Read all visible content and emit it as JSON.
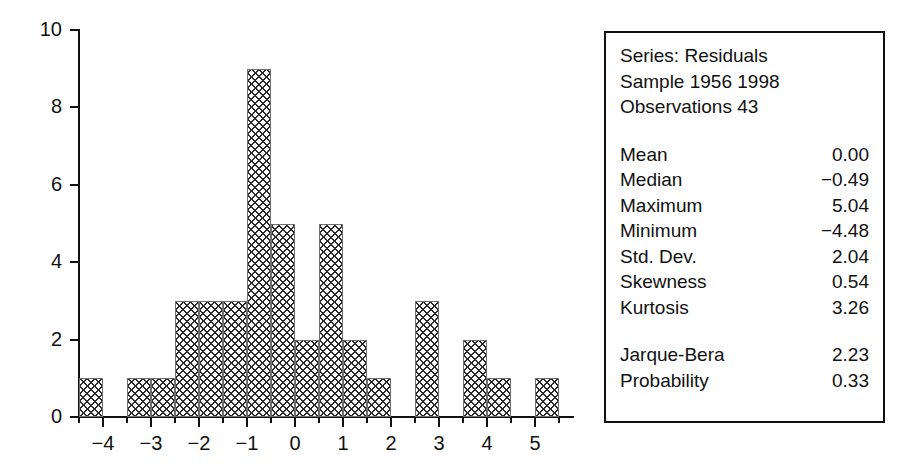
{
  "chart_data": {
    "type": "bar",
    "title": "",
    "subtitle": "",
    "xlabel": "",
    "ylabel": "",
    "xlim": [
      -4.5,
      5.5
    ],
    "ylim": [
      0,
      10
    ],
    "grid": false,
    "legend": "none",
    "bin_width": 0.5,
    "x_ticks": [
      "−4",
      "−3",
      "−2",
      "−1",
      "0",
      "1",
      "2",
      "3",
      "4",
      "5"
    ],
    "x_tick_values": [
      -4,
      -3,
      -2,
      -1,
      0,
      1,
      2,
      3,
      4,
      5
    ],
    "y_ticks": [
      "0",
      "2",
      "4",
      "6",
      "8",
      "10"
    ],
    "y_tick_values": [
      0,
      2,
      4,
      6,
      8,
      10
    ],
    "bins": [
      {
        "start": -4.5,
        "end": -4.0,
        "count": 1
      },
      {
        "start": -4.0,
        "end": -3.5,
        "count": 0
      },
      {
        "start": -3.5,
        "end": -3.0,
        "count": 1
      },
      {
        "start": -3.0,
        "end": -2.5,
        "count": 1
      },
      {
        "start": -2.5,
        "end": -2.0,
        "count": 3
      },
      {
        "start": -2.0,
        "end": -1.5,
        "count": 3
      },
      {
        "start": -1.5,
        "end": -1.0,
        "count": 3
      },
      {
        "start": -1.0,
        "end": -0.5,
        "count": 9
      },
      {
        "start": -0.5,
        "end": 0.0,
        "count": 5
      },
      {
        "start": 0.0,
        "end": 0.5,
        "count": 2
      },
      {
        "start": 0.5,
        "end": 1.0,
        "count": 5
      },
      {
        "start": 1.0,
        "end": 1.5,
        "count": 2
      },
      {
        "start": 1.5,
        "end": 2.0,
        "count": 1
      },
      {
        "start": 2.0,
        "end": 2.5,
        "count": 0
      },
      {
        "start": 2.5,
        "end": 3.0,
        "count": 3
      },
      {
        "start": 3.0,
        "end": 3.5,
        "count": 0
      },
      {
        "start": 3.5,
        "end": 4.0,
        "count": 2
      },
      {
        "start": 4.0,
        "end": 4.5,
        "count": 1
      },
      {
        "start": 4.5,
        "end": 5.0,
        "count": 0
      },
      {
        "start": 5.0,
        "end": 5.5,
        "count": 1
      }
    ],
    "categories": [
      "-4.5",
      "-4.0",
      "-3.5",
      "-3.0",
      "-2.5",
      "-2.0",
      "-1.5",
      "-1.0",
      "-0.5",
      "0.0",
      "0.5",
      "1.0",
      "1.5",
      "2.0",
      "2.5",
      "3.0",
      "3.5",
      "4.0",
      "4.5",
      "5.0"
    ],
    "values": [
      1,
      0,
      1,
      1,
      3,
      3,
      3,
      9,
      5,
      2,
      5,
      2,
      1,
      0,
      3,
      0,
      2,
      1,
      0,
      1
    ]
  },
  "stats_box": {
    "header_lines": [
      "Series: Residuals",
      "Sample 1956 1998",
      "Observations 43"
    ],
    "series_name": "Residuals",
    "sample": "1956 1998",
    "observations": "43",
    "rows": [
      {
        "key": "Mean",
        "value": "0.00"
      },
      {
        "key": "Median",
        "value": "−0.49"
      },
      {
        "key": "Maximum",
        "value": "5.04"
      },
      {
        "key": "Minimum",
        "value": "−4.48"
      },
      {
        "key": "Std. Dev.",
        "value": "2.04"
      },
      {
        "key": "Skewness",
        "value": "0.54"
      },
      {
        "key": "Kurtosis",
        "value": "3.26"
      }
    ],
    "test_rows": [
      {
        "key": "Jarque-Bera",
        "value": "2.23"
      },
      {
        "key": "Probability",
        "value": "0.33"
      }
    ]
  },
  "colors": {
    "axis": "#111111",
    "bar_outline": "#6f6f6f",
    "bar_hatch": "#2b2b2b",
    "bar_fill": "#ffffff",
    "box_border": "#111111",
    "background": "#ffffff"
  }
}
